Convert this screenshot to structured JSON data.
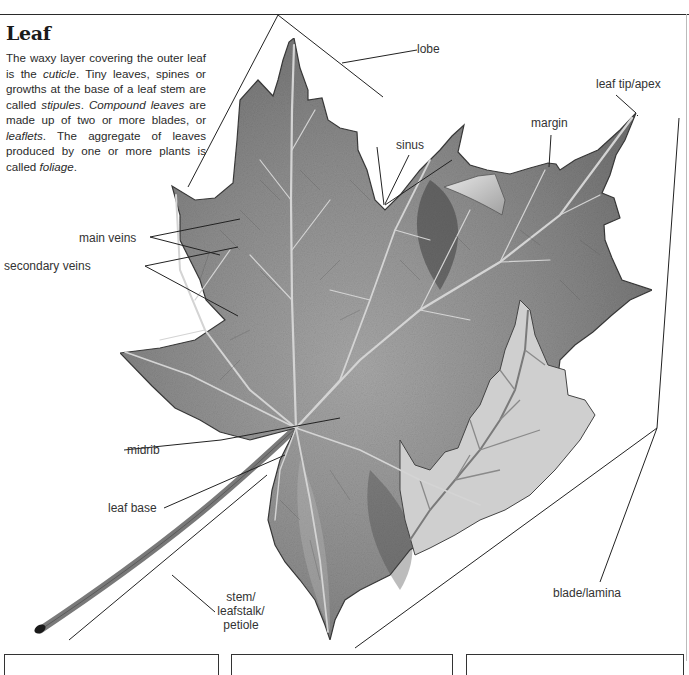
{
  "page": {
    "title": "Leaf",
    "intro": [
      {
        "text": "The waxy layer covering the outer leaf is the ",
        "italic": false
      },
      {
        "text": "cuticle",
        "italic": true
      },
      {
        "text": ". Tiny leaves, spines or growths at the base of a leaf stem are called ",
        "italic": false
      },
      {
        "text": "stipules",
        "italic": true
      },
      {
        "text": ". ",
        "italic": false
      },
      {
        "text": "Compound leaves",
        "italic": true
      },
      {
        "text": " are made up of two or more blades, or ",
        "italic": false
      },
      {
        "text": "leaflets",
        "italic": true
      },
      {
        "text": ". The aggregate of leaves produced by one or more plants is called ",
        "italic": false
      },
      {
        "text": "foliage",
        "italic": true
      },
      {
        "text": ".",
        "italic": false
      }
    ]
  },
  "labels": {
    "lobe": "lobe",
    "leaf_tip": "leaf tip/apex",
    "sinus": "sinus",
    "margin": "margin",
    "main_veins": "main veins",
    "secondary_veins": "secondary veins",
    "midrib": "midrib",
    "leaf_base": "leaf base",
    "stem_line1": "stem/",
    "stem_line2": "leafstalk/",
    "stem_line3": "petiole",
    "blade": "blade/lamina"
  },
  "colors": {
    "line": "#222222",
    "leaf_fill": "#8a8a8a",
    "leaf_dark": "#555555",
    "leaf_light": "#c8c8c8",
    "vein": "#d8d8d8",
    "text": "#333333"
  },
  "bottom_boxes": 3
}
